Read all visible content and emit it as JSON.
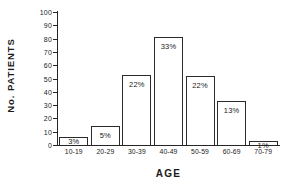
{
  "chart_data": {
    "type": "bar",
    "title": "",
    "xlabel": "AGE",
    "ylabel": "No. PATIENTS",
    "categories": [
      "10-19",
      "20-29",
      "30-39",
      "40-49",
      "50-59",
      "60-69",
      "70-79"
    ],
    "values": [
      6,
      14,
      53,
      81,
      52,
      33,
      3
    ],
    "data_labels": [
      "3%",
      "5%",
      "22%",
      "33%",
      "22%",
      "13%",
      "1%"
    ],
    "ylim": [
      0,
      100
    ],
    "yticks": [
      0,
      10,
      20,
      30,
      40,
      50,
      60,
      70,
      80,
      90,
      100
    ],
    "ytick_labels": [
      "0",
      "10",
      "20",
      "30",
      "40",
      "50",
      "60",
      "70",
      "80",
      "90",
      "100"
    ],
    "grid": false,
    "legend": null,
    "bar_fill_color": "#ffffff",
    "bar_edge_color": "#2b2b2b",
    "axis_color": "#262626",
    "background_color": "#ffffff"
  }
}
